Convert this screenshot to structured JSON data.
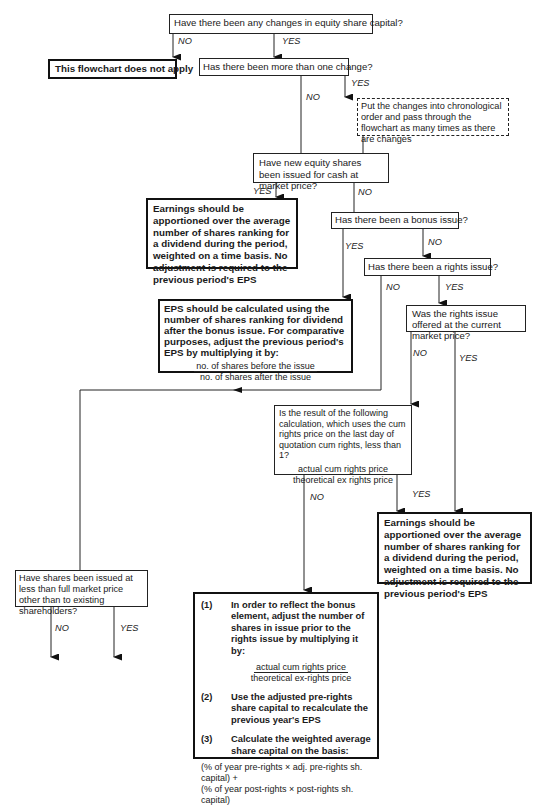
{
  "flowchart": {
    "q1": "Have there been any changes in equity share capital?",
    "not_apply": "This flowchart does not apply",
    "q2": "Has there been more than one change?",
    "chrono_note": "Put the changes into chronological order and pass through the flowchart as many times as there are changes",
    "q3": "Have new equity shares been issued for cash at market price?",
    "earnings_1": "Earnings should be apportioned over the average number of shares ranking for a dividend during the period, weighted on a time basis. No adjustment is required to the previous period's EPS",
    "q4": "Has there been a bonus issue?",
    "q5": "Has there been a rights issue?",
    "bonus_eps": {
      "text": "EPS should be calculated using the number of shares ranking for dividend after the bonus issue.  For comparative purposes, adjust the previous period's EPS by multiplying it by:",
      "numerator": "no. of shares before the issue",
      "denominator": "no. of shares after the issue"
    },
    "q6": "Was the rights issue offered at the current market price?",
    "q7": {
      "text": "Is the result of the following calculation, which uses the cum rights price on the last day of quotation cum rights, less than 1?",
      "numerator": "actual cum rights price",
      "denominator": "theoretical ex rights price"
    },
    "earnings_2": "Earnings should be apportioned over the average number of shares ranking for a dividend during the period, weighted on a time basis. No adjustment is required to the previous period's EPS",
    "q8": "Have shares been issued at less than full market price other than to existing shareholders?",
    "rights_steps": {
      "step1_num": "(1)",
      "step1": "In order to reflect the bonus element, adjust the number of shares in issue prior to the rights issue by multiplying it by:",
      "step1_numerator": "actual cum rights price",
      "step1_denominator": "theoretical ex-rights price",
      "step2_num": "(2)",
      "step2": "Use the adjusted pre-rights share capital to recalculate the previous year's EPS",
      "step3_num": "(3)",
      "step3": "Calculate the weighted average share capital on the basis:",
      "formula_1": "(% of year pre-rights × adj. pre-rights sh. capital) +",
      "formula_2": "(% of year post-rights × post-rights sh. capital)"
    },
    "labels": {
      "yes": "YES",
      "no": "NO"
    }
  }
}
